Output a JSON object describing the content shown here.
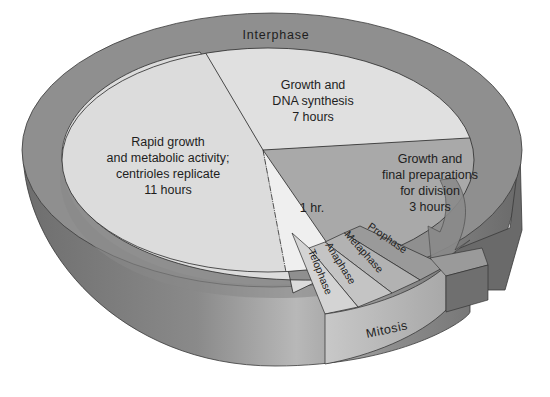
{
  "diagram": {
    "ring_labels": {
      "interphase": "Interphase",
      "mitosis": "Mitosis"
    },
    "segments": [
      {
        "id": "g1",
        "lines": [
          "Rapid growth",
          "and metabolic activity;",
          "centrioles replicate",
          "11 hours"
        ],
        "hours": 11
      },
      {
        "id": "s",
        "lines": [
          "Growth and",
          "DNA synthesis",
          "7 hours"
        ],
        "hours": 7
      },
      {
        "id": "g2",
        "lines": [
          "Growth and",
          "final preparations",
          "for division",
          "3 hours"
        ],
        "hours": 3
      },
      {
        "id": "m",
        "lines": [
          "1 hr."
        ],
        "hours": 1
      }
    ],
    "mitosis_phases": [
      "Prophase",
      "Metaphase",
      "Anaphase",
      "Telophase"
    ],
    "colors": {
      "background": "#ffffff",
      "ring_top": "#8f8f8f",
      "ring_side": "#7a7a7a",
      "ring_side_light": "#b5b5b5",
      "g1_fill": "#dcdcdc",
      "s_fill": "#e0e0e0",
      "g2_fill": "#a9a9a9",
      "m_fill": "#efefef",
      "prophase": "#9a9a9a",
      "metaphase": "#b2b2b2",
      "anaphase": "#c4c4c4",
      "telophase": "#d4d4d4",
      "mitosis_side": "#bdbdbd",
      "arrow": "#8a8a8a",
      "arrow_dark": "#6a6a6a",
      "text": "#1e1e1e"
    }
  }
}
